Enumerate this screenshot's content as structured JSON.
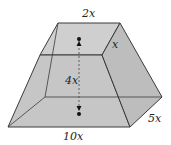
{
  "figure": {
    "type": "frustum-diagram",
    "fill_color": "#c9c9c9",
    "edge_color": "#3a3a3a",
    "labels": {
      "top_width": "2x",
      "top_depth": "x",
      "height": "4x",
      "bottom_width": "10x",
      "bottom_depth": "5x"
    }
  }
}
